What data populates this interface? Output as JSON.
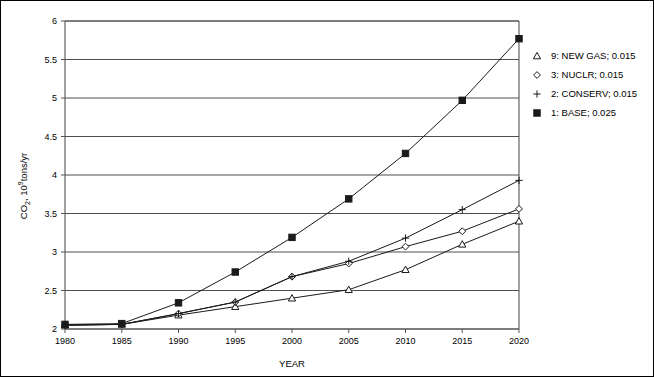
{
  "chart_data": {
    "type": "line",
    "title": "",
    "xlabel": "YEAR",
    "ylabel": "CO2, 10^9 tons/yr",
    "ylabel_parts": {
      "base": "CO",
      "sub": "2",
      "mid": ", 10",
      "sup": "9",
      "tail": "tons/yr"
    },
    "x": [
      1980,
      1985,
      1990,
      1995,
      2000,
      2005,
      2010,
      2015,
      2020
    ],
    "xtick_labels": [
      "1980",
      "1985",
      "1990",
      "1995",
      "2000",
      "2005",
      "2010",
      "2015",
      "2020"
    ],
    "ytick_labels": [
      "2",
      "2.5",
      "3",
      "3.5",
      "4",
      "4.5",
      "5",
      "5.5",
      "6"
    ],
    "ytick_values": [
      2,
      2.5,
      3,
      3.5,
      4,
      4.5,
      5,
      5.5,
      6
    ],
    "xlim": [
      1980,
      2020
    ],
    "ylim": [
      2,
      6
    ],
    "grid": "horizontal",
    "legend_position": "right-outside",
    "series": [
      {
        "name": "9: NEW GAS; 0.015",
        "key": "new_gas",
        "marker": "triangle-open",
        "values": [
          2.05,
          2.06,
          2.18,
          2.29,
          2.4,
          2.51,
          2.77,
          3.1,
          3.4
        ]
      },
      {
        "name": "3: NUCLR; 0.015",
        "key": "nuclr",
        "marker": "diamond-open",
        "values": [
          2.05,
          2.06,
          2.2,
          2.35,
          2.68,
          2.85,
          3.07,
          3.27,
          3.56
        ]
      },
      {
        "name": "2: CONSERV; 0.015",
        "key": "conserv",
        "marker": "plus",
        "values": [
          2.05,
          2.06,
          2.2,
          2.35,
          2.68,
          2.88,
          3.18,
          3.55,
          3.93
        ]
      },
      {
        "name": "1: BASE; 0.025",
        "key": "base",
        "marker": "square-filled",
        "values": [
          2.06,
          2.07,
          2.34,
          2.74,
          3.19,
          3.69,
          4.28,
          4.97,
          5.77
        ]
      }
    ]
  },
  "legend": {
    "items": [
      {
        "marker": "triangle-open",
        "label": "9: NEW GAS; 0.015"
      },
      {
        "marker": "diamond-open",
        "label": "3: NUCLR; 0.015"
      },
      {
        "marker": "plus",
        "label": "2: CONSERV; 0.015"
      },
      {
        "marker": "square-filled",
        "label": "1: BASE; 0.025"
      }
    ]
  }
}
